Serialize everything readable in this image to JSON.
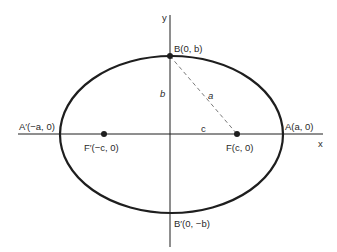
{
  "diagram": {
    "type": "ellipse-with-foci",
    "colors": {
      "stroke": "#1e1e1e",
      "dashed": "#6a6a6a",
      "text": "#2a2a2a",
      "background": "#ffffff"
    },
    "axes": {
      "x_label": "x",
      "y_label": "y"
    },
    "points": {
      "A": {
        "label": "A(a, 0)"
      },
      "A_prime": {
        "label": "A′(−a, 0)"
      },
      "B": {
        "label": "B(0, b)"
      },
      "B_prime": {
        "label": "B′(0, −b)"
      },
      "F": {
        "label": "F(c, 0)"
      },
      "F_prime": {
        "label": "F′(−c, 0)"
      }
    },
    "segments": {
      "a_label": "a",
      "b_label": "b",
      "c_label": "c"
    }
  }
}
